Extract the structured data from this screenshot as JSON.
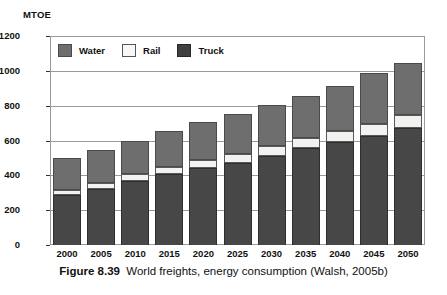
{
  "figure": {
    "axis_unit_label": "MTOE",
    "caption_label": "Figure 8.39",
    "caption_text": "World freights, energy consumption (Walsh, 2005b)"
  },
  "legend": {
    "position": "inside-top-left",
    "entries": [
      {
        "label": "Water",
        "icon": "legend-swatch-water",
        "color": "#6e6e6e"
      },
      {
        "label": "Rail",
        "icon": "legend-swatch-rail",
        "color": "#f7f7f5"
      },
      {
        "label": "Truck",
        "icon": "legend-swatch-truck",
        "color": "#3f3f3f"
      }
    ]
  },
  "yaxis": {
    "ticks": [
      "0",
      "200",
      "400",
      "600",
      "800",
      "1000",
      "1200"
    ]
  },
  "chart_data": {
    "type": "bar",
    "subtype": "stacked",
    "title": "World freights, energy consumption (Walsh, 2005b)",
    "xlabel": "",
    "ylabel": "MTOE",
    "ylim": [
      0,
      1200
    ],
    "ytick_step": 200,
    "grid": true,
    "legend_position": "inside-top-left",
    "stack_order_bottom_to_top": [
      "Truck",
      "Rail",
      "Water"
    ],
    "categories": [
      "2000",
      "2005",
      "2010",
      "2015",
      "2020",
      "2025",
      "2030",
      "2035",
      "2040",
      "2045",
      "2050"
    ],
    "series": [
      {
        "name": "Truck",
        "color": "#474747",
        "values": [
          285,
          320,
          370,
          405,
          440,
          470,
          510,
          555,
          590,
          625,
          670
        ]
      },
      {
        "name": "Rail",
        "color": "#f2f2f0",
        "values": [
          30,
          35,
          40,
          45,
          50,
          55,
          60,
          60,
          65,
          70,
          75
        ]
      },
      {
        "name": "Water",
        "color": "#6e6e6e",
        "values": [
          185,
          190,
          190,
          205,
          215,
          230,
          235,
          240,
          260,
          290,
          300
        ]
      }
    ],
    "totals": [
      500,
      545,
      600,
      655,
      705,
      755,
      805,
      855,
      915,
      985,
      1045
    ]
  }
}
